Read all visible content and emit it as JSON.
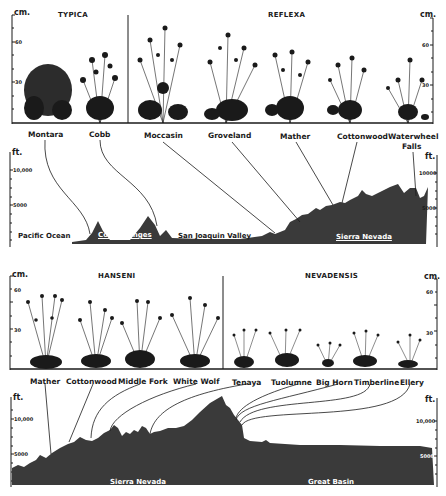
{
  "figure": {
    "top_transect": {
      "plants_panel": {
        "y_axis_unit": "cm.",
        "y_ticks": [
          "60",
          "30"
        ],
        "groups": [
          {
            "name": "TYPICA",
            "stations": [
              "Montara",
              "Cobb"
            ]
          },
          {
            "name": "REFLEXA",
            "stations": [
              "Moccasin",
              "Groveland",
              "Mather",
              "Cottonwood",
              "Waterwheel Falls"
            ]
          }
        ]
      },
      "station_labels": [
        "Montara",
        "Cobb",
        "Moccasin",
        "Groveland",
        "Mather",
        "Cottonwood",
        "Waterwheel",
        "Falls"
      ],
      "profile": {
        "y_axis_unit": "ft.",
        "y_ticks": [
          "10,000",
          "5000"
        ],
        "right_ticks": [
          "10000",
          "5000"
        ],
        "regions": [
          "Pacific Ocean",
          "Coast Ranges",
          "San Joaquin Valley",
          "Sierra Nevada"
        ]
      }
    },
    "bottom_transect": {
      "plants_panel": {
        "y_axis_unit": "cm.",
        "y_ticks": [
          "60",
          "30"
        ],
        "groups": [
          {
            "name": "HANSENI",
            "stations": [
              "Mather",
              "Cottonwood",
              "Middle Fork",
              "White Wolf"
            ]
          },
          {
            "name": "NEVADENSIS",
            "stations": [
              "Tenaya",
              "Tuolumne",
              "Big Horn",
              "Timberline",
              "Ellery"
            ]
          }
        ]
      },
      "station_labels": [
        "Mather",
        "Cottonwood",
        "Middle Fork",
        "White Wolf",
        "Tenaya",
        "Tuolumne",
        "Big Horn",
        "Timberline",
        "Ellery"
      ],
      "profile": {
        "y_axis_unit": "ft.",
        "y_ticks": [
          "10,000",
          "5000"
        ],
        "right_ticks": [
          "10,000",
          "5000"
        ],
        "regions": [
          "Sierra Nevada",
          "Great Basin"
        ]
      }
    },
    "colors": {
      "ink": "#1a1a1a",
      "terrain": "#3a3a3a",
      "paper": "#ffffff"
    }
  }
}
